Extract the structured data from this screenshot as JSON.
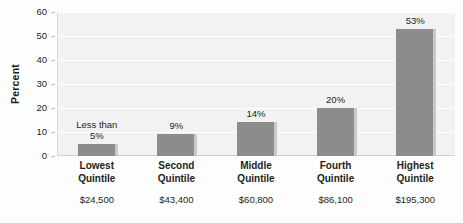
{
  "chart_data": {
    "type": "bar",
    "title": "",
    "xlabel": "",
    "ylabel": "Percent",
    "ylim": [
      0,
      60
    ],
    "ytick_values": [
      0,
      10,
      20,
      30,
      40,
      50,
      60
    ],
    "ytick_labels": [
      "0",
      "10",
      "20",
      "30",
      "40",
      "50",
      "60"
    ],
    "grid": true,
    "grid_axis": "y",
    "legend": false,
    "bar_color": "#8c8c8c",
    "plot_background": "#f2f2f2",
    "categories": [
      "Lowest Quintile",
      "Second Quintile",
      "Middle Quintile",
      "Fourth Quintile",
      "Highest Quintile"
    ],
    "category_lines": [
      [
        "Lowest",
        "Quintile"
      ],
      [
        "Second",
        "Quintile"
      ],
      [
        "Middle",
        "Quintile"
      ],
      [
        "Fourth",
        "Quintile"
      ],
      [
        "Highest",
        "Quintile"
      ]
    ],
    "category_amounts": [
      "$24,500",
      "$43,400",
      "$60,800",
      "$86,100",
      "$195,300"
    ],
    "values": [
      5,
      9,
      14,
      20,
      53
    ],
    "value_labels": [
      "Less than\n5%",
      "9%",
      "14%",
      "20%",
      "53%"
    ],
    "value_label_lines": [
      [
        "Less than",
        "5%"
      ],
      [
        "9%"
      ],
      [
        "14%"
      ],
      [
        "20%"
      ],
      [
        "53%"
      ]
    ]
  }
}
